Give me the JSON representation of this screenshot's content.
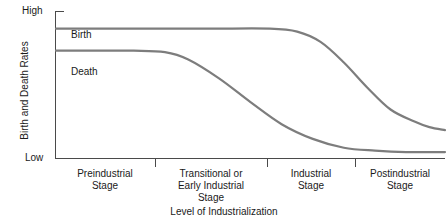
{
  "chart_data": {
    "type": "line",
    "title": "",
    "xlabel": "Level of Industrialization",
    "ylabel": "Birth and Death Rates",
    "y_tick_labels": [
      "High",
      "Low"
    ],
    "ylim": [
      "Low",
      "High"
    ],
    "grid": false,
    "legend": "inline-curve-labels",
    "categories": [
      "Preindustrial Stage",
      "Transitional or Early Industrial Stage",
      "Industrial Stage",
      "Postindustrial Stage"
    ],
    "stage_boundaries_px": [
      155,
      267,
      355
    ],
    "series": [
      {
        "name": "Birth",
        "label": "Birth",
        "color": "#7d7d7d",
        "description": "Stays high through preindustrial and transitional stages, falls sharply during the industrial stage, then levels off low in the postindustrial stage",
        "points": [
          {
            "x": 0.0,
            "y": 0.88
          },
          {
            "x": 0.12,
            "y": 0.88
          },
          {
            "x": 0.25,
            "y": 0.88
          },
          {
            "x": 0.4,
            "y": 0.88
          },
          {
            "x": 0.55,
            "y": 0.88
          },
          {
            "x": 0.62,
            "y": 0.86
          },
          {
            "x": 0.68,
            "y": 0.79
          },
          {
            "x": 0.74,
            "y": 0.65
          },
          {
            "x": 0.8,
            "y": 0.48
          },
          {
            "x": 0.86,
            "y": 0.33
          },
          {
            "x": 0.92,
            "y": 0.25
          },
          {
            "x": 0.96,
            "y": 0.21
          },
          {
            "x": 1.0,
            "y": 0.19
          }
        ]
      },
      {
        "name": "Death",
        "label": "Death",
        "color": "#7d7d7d",
        "description": "High in the preindustrial stage, drops steeply through the transitional or early industrial stage, then flattens near the bottom through the industrial and postindustrial stages",
        "points": [
          {
            "x": 0.0,
            "y": 0.73
          },
          {
            "x": 0.1,
            "y": 0.73
          },
          {
            "x": 0.2,
            "y": 0.73
          },
          {
            "x": 0.28,
            "y": 0.72
          },
          {
            "x": 0.34,
            "y": 0.67
          },
          {
            "x": 0.42,
            "y": 0.54
          },
          {
            "x": 0.5,
            "y": 0.38
          },
          {
            "x": 0.58,
            "y": 0.23
          },
          {
            "x": 0.66,
            "y": 0.13
          },
          {
            "x": 0.74,
            "y": 0.07
          },
          {
            "x": 0.82,
            "y": 0.05
          },
          {
            "x": 0.9,
            "y": 0.04
          },
          {
            "x": 1.0,
            "y": 0.04
          }
        ]
      }
    ]
  },
  "axes": {
    "y_high_label": "High",
    "y_low_label": "Low",
    "y_title": "Birth and Death Rates",
    "x_title": "Level of Industrialization"
  },
  "curve_labels": {
    "birth": "Birth",
    "death": "Death"
  },
  "stages": [
    {
      "line1": "Preindustrial",
      "line2": "Stage",
      "line3": ""
    },
    {
      "line1": "Transitional or",
      "line2": "Early Industrial",
      "line3": "Stage"
    },
    {
      "line1": "Industrial",
      "line2": "Stage",
      "line3": ""
    },
    {
      "line1": "Postindustrial",
      "line2": "Stage",
      "line3": ""
    }
  ],
  "colors": {
    "curve": "#7d7d7d",
    "axis": "#4a4a4a",
    "text": "#1a1a1a",
    "background": "#ffffff"
  }
}
